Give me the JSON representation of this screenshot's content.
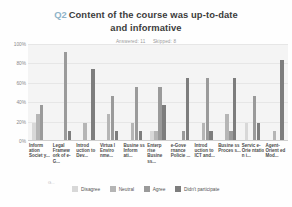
{
  "header": {
    "question_number": "Q2",
    "title_line1": "Content of the course was up-to-date",
    "title_line2": "and informative",
    "answered_label": "Answered: 11",
    "skipped_label": "Skipped: 8"
  },
  "legend": {
    "items": [
      {
        "label": "Disagree",
        "color": "#d8d8d8"
      },
      {
        "label": "Neutral",
        "color": "#b5b5b5"
      },
      {
        "label": "Agree",
        "color": "#9a9a9a"
      },
      {
        "label": "Didn't participate",
        "color": "#7d7d7d"
      }
    ],
    "stray_text": "G..."
  },
  "chart_data": {
    "type": "bar",
    "xlabel": "",
    "ylabel": "",
    "ylim": [
      0,
      100
    ],
    "grid": true,
    "legend_position": "bottom",
    "ytick_labels": [
      "100%",
      "80%",
      "60%",
      "40%",
      "20%",
      "0%"
    ],
    "ytick_values": [
      100,
      80,
      60,
      40,
      20,
      0
    ],
    "categories": [
      "Inform ation Societ y...",
      "Legal Framew ork of e-G...",
      "Introd uction to Dev...",
      "Virtua l Enviro nme...",
      "Busine ss Inform ati...",
      "Enterp rise Busine ss...",
      "e-Gove rnance Policie ...",
      "Introd uction to ICT and...",
      "Busine ss Proces s...",
      "Servic e-Orie ntatio n i...",
      "Agent-Orient ed Mod..."
    ],
    "series": [
      {
        "name": "Disagree",
        "color": "#d8d8d8",
        "values": [
          18,
          0,
          0,
          0,
          0,
          9,
          0,
          0,
          0,
          18,
          0
        ]
      },
      {
        "name": "Neutral",
        "color": "#b5b5b5",
        "values": [
          27,
          0,
          18,
          27,
          18,
          9,
          0,
          18,
          27,
          0,
          9
        ]
      },
      {
        "name": "Agree",
        "color": "#9a9a9a",
        "values": [
          36,
          91,
          0,
          45,
          55,
          55,
          9,
          64,
          9,
          45,
          0
        ]
      },
      {
        "name": "Didn't participate",
        "color": "#7d7d7d",
        "values": [
          0,
          9,
          73,
          9,
          9,
          36,
          64,
          9,
          64,
          18,
          82
        ]
      }
    ]
  }
}
